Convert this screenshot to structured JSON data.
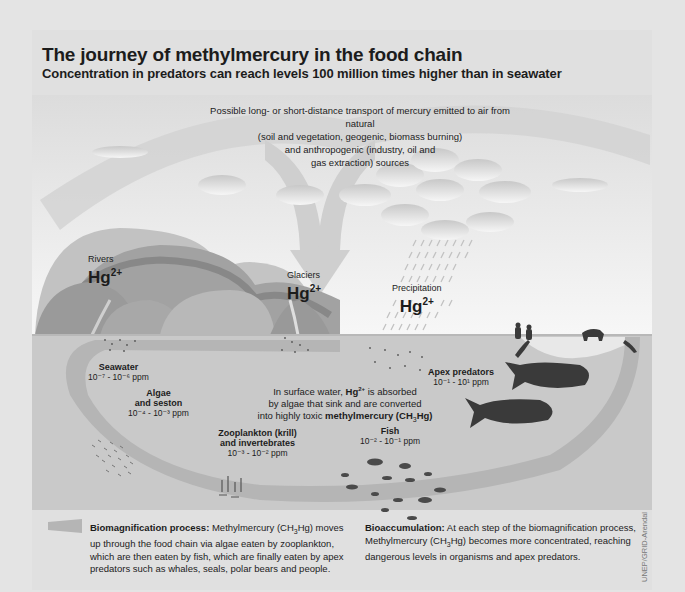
{
  "header": {
    "title": "The journey of methylmercury in the food chain",
    "subtitle": "Concentration in predators can reach levels 100 million times higher than in seawater"
  },
  "transport_note": {
    "line1": "Possible long- or short-distance transport of mercury emitted to air from natural",
    "line2": "(soil and vegetation, geogenic, biomass burning)",
    "line3": "and anthropogenic (industry, oil and",
    "line4": "gas extraction) sources"
  },
  "sources": [
    {
      "name": "Rivers",
      "species": "Hg",
      "charge": "2+"
    },
    {
      "name": "Glaciers",
      "species": "Hg",
      "charge": "2+"
    },
    {
      "name": "Precipitation",
      "species": "Hg",
      "charge": "2+"
    }
  ],
  "food_chain": {
    "seawater": {
      "name": "Seawater",
      "range": "10⁻⁷ - 10⁻⁶ ppm"
    },
    "algae": {
      "name_line1": "Algae",
      "name_line2": "and seston",
      "range": "10⁻⁴ - 10⁻³ ppm"
    },
    "zooplankton": {
      "name_line1": "Zooplankton (krill)",
      "name_line2": "and invertebrates",
      "range": "10⁻³ - 10⁻² ppm"
    },
    "fish": {
      "name": "Fish",
      "range": "10⁻² - 10⁻¹ ppm"
    },
    "apex": {
      "name": "Apex predators",
      "range": "10⁻¹ - 10¹ ppm"
    }
  },
  "center_note": {
    "line1_pre": "In surface water, ",
    "line1_bold": "Hg",
    "line1_sup": "2+",
    "line1_post": " is absorbed",
    "line2": "by algae that sink and are converted",
    "line3_pre": "into highly toxic ",
    "line3_bold": "methylmercury (CH",
    "line3_sub": "3",
    "line3_bold_end": "Hg)"
  },
  "legend": {
    "biomagnification": {
      "heading": "Biomagnification process:",
      "text_pre": " Methylmercury (CH",
      "sub": "3",
      "text_post": "Hg) moves up through the food chain via algae eaten by zooplankton, which are then eaten by fish, which are finally eaten by apex predators such as whales, seals, polar bears and people."
    },
    "bioaccumulation": {
      "heading": "Bioaccumulation:",
      "text_pre": " At each step of the biomagnification process, Methylmercury (CH",
      "sub": "3",
      "text_post": "Hg) becomes more concentrated, reaching dangerous levels in organisms and apex predators."
    }
  },
  "credit": "UNEP/GRID-Arendal",
  "colors": {
    "background": "#e4e4e4",
    "sky": "#f2f2f2",
    "sea": "#c8c8c8",
    "biomag_band": "#b4b4b4",
    "mountain_light": "#bdbdbd",
    "mountain_mid": "#a5a5a5",
    "mountain_dark": "#8f8f8f",
    "animals": "#3a3a3a",
    "text": "#1c1c1c"
  }
}
